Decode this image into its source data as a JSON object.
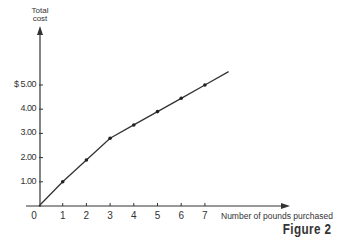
{
  "chart_data": {
    "type": "line",
    "title": "",
    "caption": "Figure 2",
    "xlabel": "Number of pounds purchased",
    "ylabel": "Total cost",
    "x": [
      0,
      1,
      2,
      3,
      4,
      5,
      6,
      7
    ],
    "values": [
      0,
      1.0,
      1.9,
      2.8,
      3.35,
      3.9,
      4.45,
      5.0
    ],
    "line_extends_to": {
      "x": 8,
      "y": 5.55
    },
    "x_ticks": [
      "0",
      "1",
      "2",
      "3",
      "4",
      "5",
      "6",
      "7"
    ],
    "y_ticks": [
      "1.00",
      "2.00",
      "3.00",
      "4.00",
      "$ 5.00"
    ],
    "y_tick_values": [
      1,
      2,
      3,
      4,
      5
    ],
    "xlim": [
      0,
      8.5
    ],
    "ylim": [
      0,
      7
    ],
    "grid": false,
    "legend": null,
    "markers": true
  },
  "labels": {
    "ylabel_line1": "Total",
    "ylabel_line2": "cost",
    "xlabel": "Number of pounds purchased",
    "caption": "Figure 2",
    "origin": "0"
  }
}
